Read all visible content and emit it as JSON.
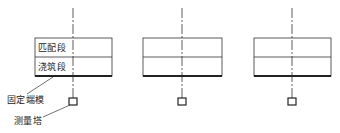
{
  "diagram": {
    "units": [
      {
        "id": "unit-1",
        "box": {
          "x": 35,
          "top": 38,
          "mid": 57,
          "bottom": 76,
          "right": 112
        },
        "axis_x": 73,
        "rows": [
          "匹配段",
          "浇筑段"
        ]
      },
      {
        "id": "unit-2",
        "box": {
          "x": 143,
          "top": 38,
          "mid": 57,
          "bottom": 76,
          "right": 222
        },
        "axis_x": 182,
        "rows": [
          "",
          ""
        ]
      },
      {
        "id": "unit-3",
        "box": {
          "x": 254,
          "top": 38,
          "mid": 57,
          "bottom": 76,
          "right": 331
        },
        "axis_x": 292,
        "rows": [
          "",
          ""
        ]
      }
    ],
    "labels": {
      "row_top": "匹配段",
      "row_bottom": "浇筑段",
      "fixed_end_mold": "固定端模",
      "survey_tower": "测量塔"
    },
    "colors": {
      "line": "#333333",
      "thick": "#222222"
    }
  }
}
